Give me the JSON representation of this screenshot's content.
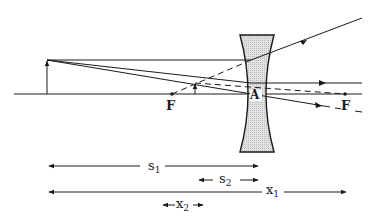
{
  "diagram": {
    "type": "ray-diagram-diverging-lens",
    "colors": {
      "ink": "#1a1a1a",
      "lens_fill": "#d6d6d6"
    },
    "labels": {
      "focal_left": "F",
      "focal_right": "F",
      "center": "A"
    },
    "dimensions": [
      {
        "id": "s1",
        "base": "s",
        "sub": "1"
      },
      {
        "id": "s2",
        "base": "s",
        "sub": "2"
      },
      {
        "id": "x1",
        "base": "x",
        "sub": "1"
      },
      {
        "id": "x2",
        "base": "x",
        "sub": "2"
      }
    ]
  }
}
